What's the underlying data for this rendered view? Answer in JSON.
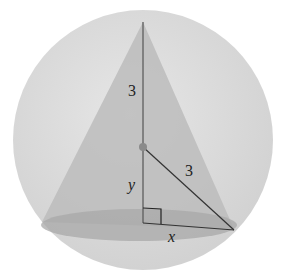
{
  "diagram": {
    "labels": {
      "upper_height": "3",
      "radius_slant": "3",
      "lower_segment": "y",
      "base_radius": "x"
    },
    "colors": {
      "sphere": "#dcdcdc",
      "cone": "#b9b9b9",
      "base": "#a9a9a9",
      "lines": "#555555",
      "center_dot": "#8a8a8a"
    }
  }
}
